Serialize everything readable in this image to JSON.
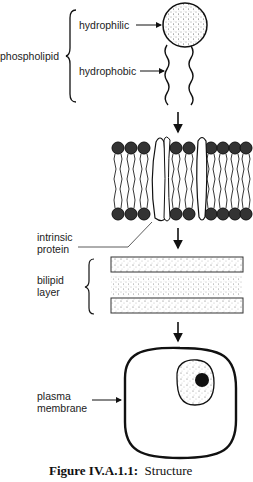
{
  "diagram": {
    "type": "biology-figure",
    "stages": [
      {
        "id": "phospholipid",
        "label": "phospholipid",
        "parts": [
          {
            "label": "hydrophilic",
            "refers_to": "head"
          },
          {
            "label": "hydrophobic",
            "refers_to": "tails"
          }
        ]
      },
      {
        "id": "membrane-section",
        "label": "intrinsic\nprotein"
      },
      {
        "id": "bilipid-layer",
        "label": "bilipid\nlayer"
      },
      {
        "id": "cell",
        "label": "plasma\nmembrane"
      }
    ]
  },
  "labels": {
    "phospholipid": "phospholipid",
    "hydrophilic": "hydrophilic",
    "hydrophobic": "hydrophobic",
    "intrinsic_1": "intrinsic",
    "intrinsic_2": "protein",
    "bilipid_1": "bilipid",
    "bilipid_2": "layer",
    "plasma_1": "plasma",
    "plasma_2": "membrane"
  },
  "caption": {
    "figure_no": "Figure IV.A.1.1:",
    "text": "Structure"
  },
  "colors": {
    "ink": "#111111",
    "paper": "#ffffff"
  }
}
